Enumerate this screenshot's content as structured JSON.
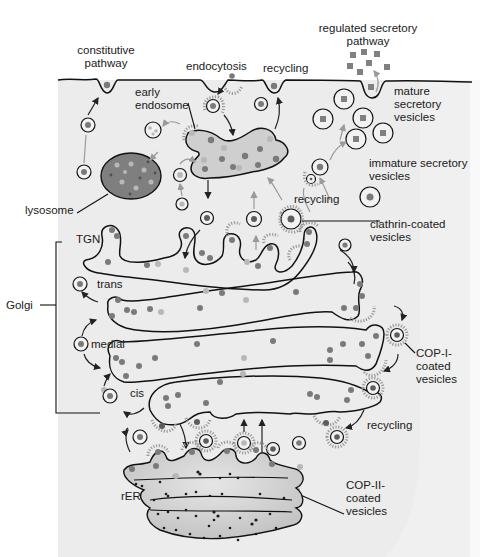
{
  "diagram": {
    "labels": {
      "constitutive_pathway": "constitutive\npathway",
      "endocytosis": "endocytosis",
      "recycling_top": "recycling",
      "regulated_secretory_pathway": "regulated secretory\npathway",
      "mature_secretory_vesicles": "mature\nsecretory\nvesicles",
      "early_endosome": "early\nendosome",
      "immature_secretory_vesicles": "immature secretory\nvesicles",
      "lysosome": "lysosome",
      "recycling_middle": "recycling",
      "clathrin_coated_vesicles": "clathrin-coated\nvesicles",
      "tgn": "TGN",
      "trans": "trans",
      "golgi": "Golgi",
      "medial": "medial",
      "cis": "cis",
      "cop1_coated_vesicles": "COP-I-\ncoated\nvesicles",
      "recycling_bottom": "recycling",
      "rer": "rER",
      "cop2_coated_vesicles": "COP-II-\ncoated\nvesicles"
    },
    "colors": {
      "cytoplasm": "#ececec",
      "membrane": "#111111",
      "cargo_dark": "#6e6e6e",
      "cargo_light": "#b8b8b8",
      "lysosome_fill": "#7f7f7f",
      "endosome_fill": "#cfcfcf",
      "coat": "#9a9a9a"
    }
  }
}
